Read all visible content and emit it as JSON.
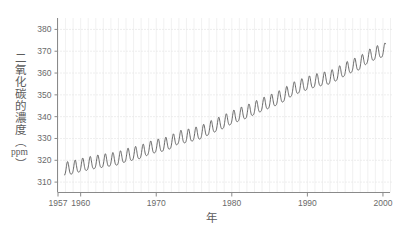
{
  "chart_data": {
    "type": "line",
    "title": "",
    "subtitle": "",
    "xlabel": "年",
    "ylabel": "二氧化碳的濃度（ppm）",
    "ylabel_parts": {
      "main": "二氧化碳的濃度",
      "paren_open": "（",
      "unit": "ppm",
      "paren_close": "）"
    },
    "xlim": [
      1957,
      2001
    ],
    "ylim": [
      305,
      385
    ],
    "xticks": [
      1957,
      1960,
      1970,
      1980,
      1990,
      2000
    ],
    "xtick_labels": [
      "1957",
      "1960",
      "1970",
      "1980",
      "1990",
      "2000"
    ],
    "yticks": [
      310,
      320,
      330,
      340,
      350,
      360,
      370,
      380
    ],
    "ytick_labels": [
      "310",
      "320",
      "330",
      "340",
      "350",
      "360",
      "370",
      "380"
    ],
    "grid": true,
    "grid_style": "dotted",
    "legend": null,
    "series": [
      {
        "name": "大氣二氧化碳濃度 (Mauna Loa)",
        "color": "#585858",
        "line_width": 0.9,
        "seasonal_amplitude_ppm": 3.0,
        "seasonal_peak_month": 5,
        "x": [
          1958.0,
          1959.0,
          1960.0,
          1961.0,
          1962.0,
          1963.0,
          1964.0,
          1965.0,
          1966.0,
          1967.0,
          1968.0,
          1969.0,
          1970.0,
          1971.0,
          1972.0,
          1973.0,
          1974.0,
          1975.0,
          1976.0,
          1977.0,
          1978.0,
          1979.0,
          1980.0,
          1981.0,
          1982.0,
          1983.0,
          1984.0,
          1985.0,
          1986.0,
          1987.0,
          1988.0,
          1989.0,
          1990.0,
          1991.0,
          1992.0,
          1993.0,
          1994.0,
          1995.0,
          1996.0,
          1997.0,
          1998.0,
          1999.0,
          2000.0
        ],
        "annual_mean_ppm": [
          315.3,
          315.9,
          316.9,
          317.6,
          318.4,
          318.9,
          319.5,
          320.0,
          321.4,
          322.2,
          323.0,
          324.6,
          325.7,
          326.3,
          327.5,
          329.7,
          330.2,
          331.1,
          332.0,
          333.8,
          335.4,
          336.8,
          338.7,
          340.1,
          341.4,
          343.0,
          344.6,
          346.0,
          347.4,
          349.2,
          351.6,
          353.1,
          354.4,
          355.6,
          356.4,
          357.1,
          358.8,
          360.8,
          362.6,
          363.7,
          366.6,
          368.3,
          369.5
        ]
      }
    ],
    "source_note": "",
    "annotations": []
  },
  "axes": {
    "y_axis_name": "co2-concentration-axis",
    "x_axis_name": "year-axis"
  }
}
